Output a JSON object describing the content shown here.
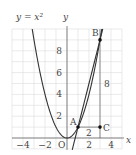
{
  "figure": {
    "curve_label": "y = x²",
    "x_axis_label": "x",
    "y_axis_label": "y",
    "origin_label": "O",
    "x_ticks": [
      {
        "value": -4,
        "label": "−4"
      },
      {
        "value": -2,
        "label": "−2"
      },
      {
        "value": 2,
        "label": "2"
      },
      {
        "value": 4,
        "label": "4"
      }
    ],
    "y_ticks": [
      {
        "value": 2,
        "label": "2"
      },
      {
        "value": 4,
        "label": "4"
      },
      {
        "value": 6,
        "label": "6"
      },
      {
        "value": 8,
        "label": "8"
      }
    ],
    "points": [
      {
        "name": "A",
        "x": 1,
        "y": 1
      },
      {
        "name": "B",
        "x": 3,
        "y": 9
      },
      {
        "name": "C",
        "x": 3,
        "y": 1
      }
    ],
    "segment_labels": {
      "AC_length": "2",
      "BC_length": "8"
    },
    "line_through": "A and B",
    "grid": {
      "x_min": -5,
      "x_max": 5,
      "y_min": -1,
      "y_max": 10,
      "step": 1
    },
    "colors": {
      "curve": "#333333",
      "grid": "#dcdcdc",
      "axis": "#555555"
    }
  }
}
